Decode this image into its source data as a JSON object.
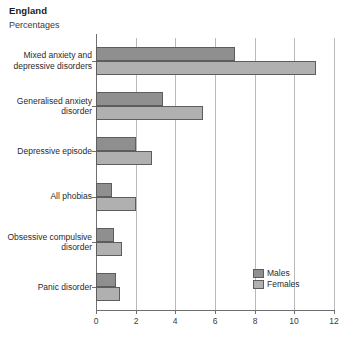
{
  "header": {
    "title": "England",
    "subtitle": "Percentages"
  },
  "legend": {
    "position": "bottom-right",
    "items": [
      {
        "label": "Males",
        "color": "#8f8f8f"
      },
      {
        "label": "Females",
        "color": "#b0b0b0"
      }
    ]
  },
  "chart_data": {
    "type": "bar",
    "orientation": "horizontal",
    "title": "England",
    "subtitle": "Percentages",
    "xlabel": "",
    "ylabel": "",
    "xlim": [
      0,
      12
    ],
    "xticks": [
      "0",
      "2",
      "4",
      "6",
      "8",
      "10",
      "12"
    ],
    "grid": true,
    "categories": [
      "Mixed anxiety and\ndepressive disorders",
      "Generalised anxiety\ndisorder",
      "Depressive episode",
      "All phobias",
      "Obsessive compulsive\ndisorder",
      "Panic disorder"
    ],
    "series": [
      {
        "name": "Males",
        "color": "#8f8f8f",
        "values": [
          7.0,
          3.4,
          2.0,
          0.8,
          0.9,
          1.0
        ]
      },
      {
        "name": "Females",
        "color": "#b0b0b0",
        "values": [
          11.1,
          5.4,
          2.8,
          2.0,
          1.3,
          1.2
        ]
      }
    ]
  }
}
